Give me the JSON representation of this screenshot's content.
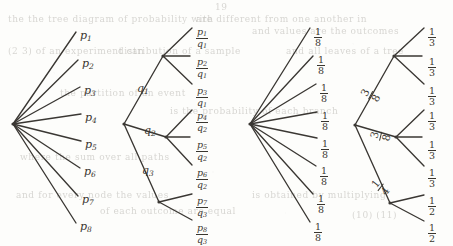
{
  "figure": {
    "background_color": "#fdfdfb",
    "ink_color": "#3a3733"
  },
  "bleed_through_text": [
    {
      "text": "the the tree diagram of probability with",
      "x": 8,
      "y": 14
    },
    {
      "text": "are different from one another in",
      "x": 196,
      "y": 14
    },
    {
      "text": "and values are the outcomes",
      "x": 252,
      "y": 26
    },
    {
      "text": "(2 3) of an experiment can",
      "x": 8,
      "y": 46
    },
    {
      "text": "distribution of a sample",
      "x": 118,
      "y": 46
    },
    {
      "text": "and all leaves of a tree",
      "x": 286,
      "y": 46
    },
    {
      "text": "the partition of an event",
      "x": 60,
      "y": 88
    },
    {
      "text": "is the probability of each branch",
      "x": 170,
      "y": 106
    },
    {
      "text": "where the sum over all paths",
      "x": 20,
      "y": 152
    },
    {
      "text": "and for every node the values",
      "x": 16,
      "y": 190
    },
    {
      "text": "of each outcome are equal",
      "x": 100,
      "y": 206
    },
    {
      "text": "is obtained by multiplying",
      "x": 252,
      "y": 190
    },
    {
      "text": "(10) (11)",
      "x": 352,
      "y": 210
    },
    {
      "text": "19",
      "x": 215,
      "y": 2
    }
  ],
  "trees": [
    {
      "id": "tree-uniform-p",
      "name": "eight-branch-p-tree",
      "root": {
        "x": 13,
        "y": 124
      },
      "branch_labels": [],
      "leaves": [
        {
          "label": "p",
          "sub": "1",
          "kind": "plain",
          "x": 80,
          "y": 24,
          "end_x": 76,
          "end_y": 32
        },
        {
          "label": "p",
          "sub": "2",
          "kind": "plain",
          "x": 82,
          "y": 52,
          "end_x": 78,
          "end_y": 60
        },
        {
          "label": "p",
          "sub": "3",
          "kind": "plain",
          "x": 84,
          "y": 79,
          "end_x": 80,
          "end_y": 87
        },
        {
          "label": "p",
          "sub": "4",
          "kind": "plain",
          "x": 85,
          "y": 106,
          "end_x": 81,
          "end_y": 114
        },
        {
          "label": "p",
          "sub": "5",
          "kind": "plain",
          "x": 85,
          "y": 133,
          "end_x": 81,
          "end_y": 141
        },
        {
          "label": "p",
          "sub": "6",
          "kind": "plain",
          "x": 84,
          "y": 160,
          "end_x": 80,
          "end_y": 168
        },
        {
          "label": "p",
          "sub": "7",
          "kind": "plain",
          "x": 82,
          "y": 188,
          "end_x": 78,
          "end_y": 196
        },
        {
          "label": "p",
          "sub": "8",
          "kind": "plain",
          "x": 80,
          "y": 215,
          "end_x": 76,
          "end_y": 223
        }
      ]
    },
    {
      "id": "tree-conditional-pq",
      "name": "three-level-pq-tree",
      "root": {
        "x": 124,
        "y": 124
      },
      "internal_nodes": [
        {
          "x": 163,
          "y": 56,
          "name": "node-q1"
        },
        {
          "x": 166,
          "y": 137,
          "name": "node-q2"
        },
        {
          "x": 159,
          "y": 202,
          "name": "node-q3"
        }
      ],
      "branch_labels": [
        {
          "text": "q",
          "sub": "1",
          "x": 137,
          "y": 77
        },
        {
          "text": "q",
          "sub": "2",
          "x": 144,
          "y": 119
        },
        {
          "text": "q",
          "sub": "3",
          "x": 142,
          "y": 159
        }
      ],
      "leaves": [
        {
          "num": "p",
          "num_sub": "1",
          "den": "q",
          "den_sub": "1",
          "x": 196,
          "y": 20,
          "end_x": 192,
          "end_y": 28
        },
        {
          "num": "p",
          "num_sub": "2",
          "den": "q",
          "den_sub": "1",
          "x": 196,
          "y": 50,
          "end_x": 190,
          "end_y": 56
        },
        {
          "num": "p",
          "num_sub": "3",
          "den": "q",
          "den_sub": "1",
          "x": 196,
          "y": 79,
          "end_x": 192,
          "end_y": 84
        },
        {
          "num": "p",
          "num_sub": "4",
          "den": "q",
          "den_sub": "2",
          "x": 196,
          "y": 104,
          "end_x": 192,
          "end_y": 110
        },
        {
          "num": "p",
          "num_sub": "5",
          "den": "q",
          "den_sub": "2",
          "x": 196,
          "y": 133,
          "end_x": 190,
          "end_y": 137
        },
        {
          "num": "p",
          "num_sub": "6",
          "den": "q",
          "den_sub": "2",
          "x": 196,
          "y": 161,
          "end_x": 192,
          "end_y": 165
        },
        {
          "num": "p",
          "num_sub": "7",
          "den": "q",
          "den_sub": "3",
          "x": 196,
          "y": 189,
          "end_x": 192,
          "end_y": 194
        },
        {
          "num": "p",
          "num_sub": "8",
          "den": "q",
          "den_sub": "3",
          "x": 196,
          "y": 216,
          "end_x": 192,
          "end_y": 220
        }
      ]
    },
    {
      "id": "tree-uniform-eighths",
      "name": "eight-branch-one-eighth-tree",
      "root": {
        "x": 250,
        "y": 124
      },
      "branch_labels": [],
      "leaves": [
        {
          "num": "1",
          "den": "8",
          "x": 314,
          "y": 20,
          "end_x": 310,
          "end_y": 28
        },
        {
          "num": "1",
          "den": "8",
          "x": 317,
          "y": 48,
          "end_x": 313,
          "end_y": 56
        },
        {
          "num": "1",
          "den": "8",
          "x": 320,
          "y": 76,
          "end_x": 316,
          "end_y": 84
        },
        {
          "num": "1",
          "den": "8",
          "x": 321,
          "y": 104,
          "end_x": 317,
          "end_y": 112
        },
        {
          "num": "1",
          "den": "8",
          "x": 321,
          "y": 132,
          "end_x": 317,
          "end_y": 138
        },
        {
          "num": "1",
          "den": "8",
          "x": 320,
          "y": 159,
          "end_x": 316,
          "end_y": 166
        },
        {
          "num": "1",
          "den": "8",
          "x": 317,
          "y": 187,
          "end_x": 313,
          "end_y": 194
        },
        {
          "num": "1",
          "den": "8",
          "x": 314,
          "y": 215,
          "end_x": 310,
          "end_y": 222
        }
      ]
    },
    {
      "id": "tree-mixed-fractions",
      "name": "three-branch-weighted-tree",
      "root": {
        "x": 355,
        "y": 125
      },
      "internal_nodes": [
        {
          "x": 394,
          "y": 56,
          "name": "node-three-eighths-upper"
        },
        {
          "x": 396,
          "y": 137,
          "name": "node-three-eighths-lower"
        },
        {
          "x": 390,
          "y": 203,
          "name": "node-one-quarter"
        }
      ],
      "branch_labels": [
        {
          "num": "3",
          "den": "8",
          "x": 366,
          "y": 78,
          "rot": "rot"
        },
        {
          "num": "3",
          "den": "8",
          "x": 376,
          "y": 119,
          "rot": "rot2"
        },
        {
          "num": "1",
          "den": "4",
          "x": 376,
          "y": 170,
          "rot": "rot3"
        }
      ],
      "leaves": [
        {
          "num": "1",
          "den": "3",
          "x": 428,
          "y": 20,
          "end_x": 424,
          "end_y": 28
        },
        {
          "num": "1",
          "den": "3",
          "x": 428,
          "y": 50,
          "end_x": 422,
          "end_y": 56
        },
        {
          "num": "1",
          "den": "3",
          "x": 428,
          "y": 79,
          "end_x": 424,
          "end_y": 84
        },
        {
          "num": "1",
          "den": "3",
          "x": 428,
          "y": 104,
          "end_x": 424,
          "end_y": 110
        },
        {
          "num": "1",
          "den": "3",
          "x": 428,
          "y": 133,
          "end_x": 422,
          "end_y": 137
        },
        {
          "num": "1",
          "den": "3",
          "x": 428,
          "y": 161,
          "end_x": 424,
          "end_y": 166
        },
        {
          "num": "1",
          "den": "2",
          "x": 428,
          "y": 189,
          "end_x": 424,
          "end_y": 195
        },
        {
          "num": "1",
          "den": "2",
          "x": 428,
          "y": 216,
          "end_x": 424,
          "end_y": 221
        }
      ]
    }
  ],
  "page_number": "19"
}
